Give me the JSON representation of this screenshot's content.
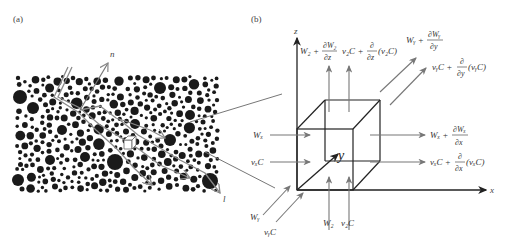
{
  "panels": {
    "a": {
      "label": "(a)"
    },
    "b": {
      "label": "(b)"
    }
  },
  "left_panel": {
    "axis_n": "n",
    "axis_l": "l",
    "particle_color": "#1a1a1a"
  },
  "right_panel": {
    "axes": {
      "x": "x",
      "y": "y",
      "z": "z"
    },
    "inflow": {
      "wx": "Wₓ",
      "vxC": "vₓC",
      "wy": "Wᵧ",
      "vyC": "vᵧC",
      "wz": "W₂",
      "vzC": "v₂C"
    },
    "outflow": {
      "z_w_base": "W₂ +",
      "z_w_num": "∂W₂",
      "z_w_den": "∂z",
      "z_c_base": "v₂C +",
      "z_c_num": "∂",
      "z_c_den": "∂z",
      "z_c_tail": "(v₂C)",
      "y_w_base": "Wᵧ +",
      "y_w_num": "∂Wᵧ",
      "y_w_den": "∂y",
      "y_c_base": "vᵧC +",
      "y_c_num": "∂",
      "y_c_den": "∂y",
      "y_c_tail": "(vᵧC)",
      "x_w_base": "Wₓ +",
      "x_w_num": "∂Wₓ",
      "x_w_den": "∂x",
      "x_c_base": "vₓC +",
      "x_c_num": "∂",
      "x_c_den": "∂x",
      "x_c_tail": "(vₓC)"
    }
  }
}
